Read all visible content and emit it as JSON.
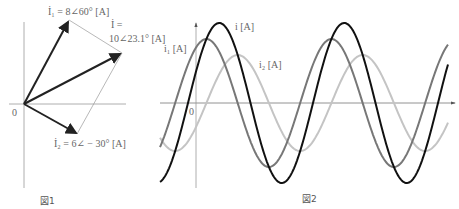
{
  "figure1": {
    "caption": "図1",
    "origin_label": "0",
    "vectors": [
      {
        "name": "I1",
        "label": "İ₁ = 8∠60° [A]",
        "magnitude": 8,
        "angle_deg": 60
      },
      {
        "name": "I2",
        "label": "İ₂ = 6∠ − 30° [A]",
        "magnitude": 6,
        "angle_deg": -30
      },
      {
        "name": "I",
        "label_line1": "İ =",
        "label_line2": "10∠23.1° [A]",
        "magnitude": 10,
        "angle_deg": 23.1
      }
    ]
  },
  "figure2": {
    "caption": "図2",
    "origin_label": "0",
    "curves": [
      {
        "name": "i",
        "label": "i [A]",
        "amplitude": 10,
        "phase_deg": 23.1,
        "color": "#111111"
      },
      {
        "name": "i1",
        "label": "i₁ [A]",
        "amplitude": 8,
        "phase_deg": 60,
        "color": "#777777"
      },
      {
        "name": "i2",
        "label": "i₂ [A]",
        "amplitude": 6,
        "phase_deg": -30,
        "color": "#c4c4c4"
      }
    ]
  },
  "chart_data": {
    "type": "line",
    "title": "図2",
    "xlabel": "",
    "ylabel": "",
    "series": [
      {
        "name": "i [A]",
        "amplitude": 10,
        "phase_deg": 23.1
      },
      {
        "name": "i₁ [A]",
        "amplitude": 8,
        "phase_deg": 60
      },
      {
        "name": "i₂ [A]",
        "amplitude": 6,
        "phase_deg": -30
      }
    ],
    "grid": false
  }
}
